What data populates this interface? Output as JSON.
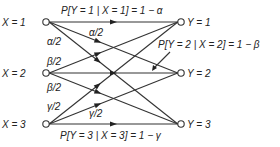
{
  "inputs": [
    {
      "id": "x1",
      "label": "X = 1"
    },
    {
      "id": "x2",
      "label": "X = 2"
    },
    {
      "id": "x3",
      "label": "X = 3"
    }
  ],
  "outputs": [
    {
      "id": "y1",
      "label": "Y = 1"
    },
    {
      "id": "y2",
      "label": "Y = 2"
    },
    {
      "id": "y3",
      "label": "Y = 3"
    }
  ],
  "edges": [
    {
      "from": 0,
      "to": 0,
      "label": "P[Y = 1 | X = 1] = 1 − α"
    },
    {
      "from": 0,
      "to": 1,
      "label": "α/2"
    },
    {
      "from": 0,
      "to": 2,
      "label": "α/2"
    },
    {
      "from": 1,
      "to": 0,
      "label": "β/2"
    },
    {
      "from": 1,
      "to": 1,
      "label": "P[Y = 2 | X = 2] = 1 − β"
    },
    {
      "from": 1,
      "to": 2,
      "label": "β/2"
    },
    {
      "from": 2,
      "to": 0,
      "label": "γ/2"
    },
    {
      "from": 2,
      "to": 1,
      "label": "γ/2"
    },
    {
      "from": 2,
      "to": 2,
      "label": "P[Y = 3 | X = 3] = 1 − γ"
    }
  ]
}
